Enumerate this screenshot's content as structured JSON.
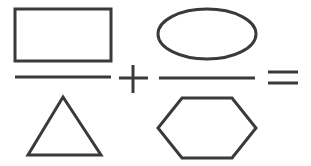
{
  "diagram": {
    "stroke_color": "#3a3a3a",
    "background": "#ffffff",
    "stroke_width": 3,
    "terms": [
      {
        "numerator": {
          "shape": "rectangle",
          "x": 15,
          "y": 9,
          "width": 96,
          "height": 52
        },
        "fraction_bar": {
          "x1": 15,
          "y1": 77,
          "x2": 111,
          "y2": 77
        },
        "denominator": {
          "shape": "triangle",
          "points": "63,97 101,155 28,155"
        }
      },
      {
        "numerator": {
          "shape": "ellipse",
          "cx": 207,
          "cy": 34,
          "rx": 49,
          "ry": 25
        },
        "fraction_bar": {
          "x1": 159,
          "y1": 78,
          "x2": 255,
          "y2": 78
        },
        "denominator": {
          "shape": "hexagon",
          "points": "182,98 232,98 256,128 232,158 182,158 158,128"
        }
      }
    ],
    "operators": [
      {
        "symbol": "+",
        "name": "plus"
      },
      {
        "symbol": "=",
        "name": "equals"
      }
    ]
  }
}
